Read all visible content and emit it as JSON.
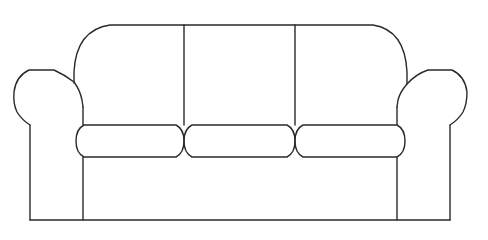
{
  "drawing": {
    "subject": "sofa",
    "style": "black line art on white",
    "colors": {
      "background": "#ffffff",
      "line": "#2a2a2a"
    },
    "parts": {
      "back_sections": 3,
      "seat_cushions": 3,
      "arms": 2
    }
  }
}
